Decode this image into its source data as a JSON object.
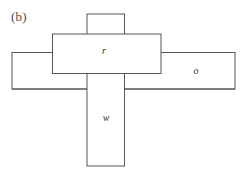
{
  "figure": {
    "panel_label": "(b)",
    "background_color": "#ffffff",
    "stroke_color": "#555555",
    "stroke_width": 1,
    "width": 244,
    "height": 179,
    "rectangles": [
      {
        "name": "vertical-bar",
        "label": "w",
        "x": 87,
        "y": 14,
        "width": 37.5,
        "height": 152
      },
      {
        "name": "upper-horizontal-bar",
        "label": "r",
        "x": 52.5,
        "y": 34,
        "width": 108.5,
        "height": 39.5
      },
      {
        "name": "lower-horizontal-bar",
        "label": "o",
        "x": 12,
        "y": 52.5,
        "width": 223,
        "height": 36.5
      }
    ]
  }
}
